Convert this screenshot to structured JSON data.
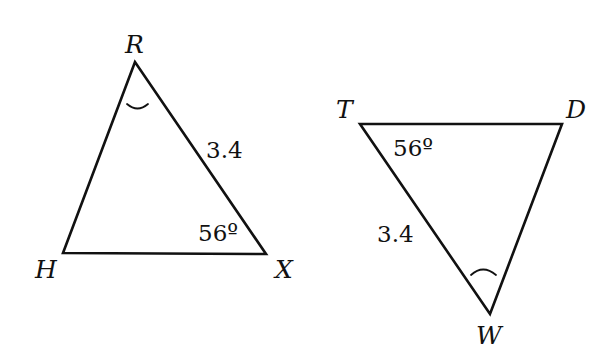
{
  "triangles": [
    {
      "name": "RHX",
      "vertices": {
        "R": {
          "label": "R",
          "x": 135,
          "y": 62
        },
        "H": {
          "label": "H",
          "x": 63,
          "y": 253
        },
        "X": {
          "label": "X",
          "x": 266,
          "y": 254
        }
      },
      "side_label": {
        "side": "RX",
        "text": "3.4"
      },
      "angle_label": {
        "vertex": "X",
        "text": "56º"
      },
      "angle_mark": {
        "vertex": "R",
        "type": "single-arc"
      }
    },
    {
      "name": "TDW",
      "vertices": {
        "T": {
          "label": "T",
          "x": 360,
          "y": 124
        },
        "D": {
          "label": "D",
          "x": 562,
          "y": 124
        },
        "W": {
          "label": "W",
          "x": 490,
          "y": 314
        }
      },
      "side_label": {
        "side": "TW",
        "text": "3.4"
      },
      "angle_label": {
        "vertex": "T",
        "text": "56º"
      },
      "angle_mark": {
        "vertex": "W",
        "type": "single-arc"
      }
    }
  ],
  "colors": {
    "stroke": "#111111",
    "background": "#ffffff"
  }
}
